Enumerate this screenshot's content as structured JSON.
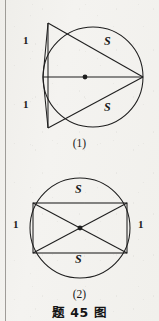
{
  "caption": "题 45 图",
  "stroke_color": "#1e1e1e",
  "page_background": "#f2f1ee",
  "figures": [
    {
      "id": "figure-1",
      "number_label": "(1)",
      "shape": "circle-with-inscribed-triangles",
      "circle": {
        "cx": 93,
        "cy": 77,
        "r": 50
      },
      "center_dot": {
        "cx": 85,
        "cy": 77,
        "r": 2.4
      },
      "points": {
        "left": {
          "x": 43,
          "y": 77
        },
        "right": {
          "x": 143,
          "y": 77
        },
        "top": {
          "x": 48,
          "y": 23
        },
        "bottom": {
          "x": 48,
          "y": 128
        }
      },
      "labels": [
        {
          "text": "1",
          "x": 23,
          "y": 40,
          "role": "side-length-upper-left"
        },
        {
          "text": "1",
          "x": 23,
          "y": 104,
          "role": "side-length-lower-left"
        },
        {
          "text": "S",
          "x": 104,
          "y": 41,
          "role": "area-upper"
        },
        {
          "text": "S",
          "x": 104,
          "y": 107,
          "role": "area-lower"
        }
      ]
    },
    {
      "id": "figure-2",
      "number_label": "(2)",
      "shape": "circle-with-inscribed-rectangle-and-diagonals",
      "circle": {
        "cx": 80,
        "cy": 228,
        "r": 50
      },
      "center_dot": {
        "cx": 80,
        "cy": 228,
        "r": 2.4
      },
      "rectangle": {
        "x1": 33,
        "y1": 203,
        "x2": 127,
        "y2": 253
      },
      "labels": [
        {
          "text": "1",
          "x": 13,
          "y": 224,
          "role": "side-length-left"
        },
        {
          "text": "1",
          "x": 138,
          "y": 224,
          "role": "side-length-right"
        },
        {
          "text": "S",
          "x": 75,
          "y": 189,
          "role": "area-upper"
        },
        {
          "text": "S",
          "x": 75,
          "y": 258,
          "role": "area-lower"
        }
      ]
    }
  ]
}
